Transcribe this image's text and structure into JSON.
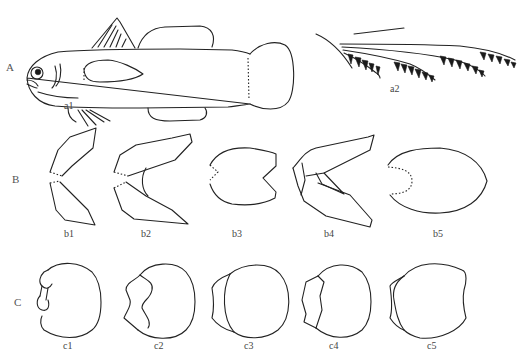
{
  "figure": {
    "rows": [
      {
        "id": "A",
        "label": "A",
        "panels": [
          {
            "id": "a1",
            "label": "a1",
            "subject": "whole fish lateral view"
          },
          {
            "id": "a2",
            "label": "a2",
            "subject": "gill filaments"
          }
        ]
      },
      {
        "id": "B",
        "label": "B",
        "panels": [
          {
            "id": "b1",
            "label": "b1",
            "subject": "caudal fin shape"
          },
          {
            "id": "b2",
            "label": "b2",
            "subject": "caudal fin shape"
          },
          {
            "id": "b3",
            "label": "b3",
            "subject": "caudal fin shape"
          },
          {
            "id": "b4",
            "label": "b4",
            "subject": "caudal fin shape"
          },
          {
            "id": "b5",
            "label": "b5",
            "subject": "caudal fin shape"
          }
        ]
      },
      {
        "id": "C",
        "label": "C",
        "panels": [
          {
            "id": "c1",
            "label": "c1",
            "subject": "scale / disc outline"
          },
          {
            "id": "c2",
            "label": "c2",
            "subject": "scale / disc outline"
          },
          {
            "id": "c3",
            "label": "c3",
            "subject": "scale / disc outline"
          },
          {
            "id": "c4",
            "label": "c4",
            "subject": "scale / disc outline"
          },
          {
            "id": "c5",
            "label": "c5",
            "subject": "scale / disc outline"
          }
        ]
      }
    ],
    "colors": {
      "line": "#222222",
      "label": "#444444",
      "background": "#ffffff"
    }
  }
}
